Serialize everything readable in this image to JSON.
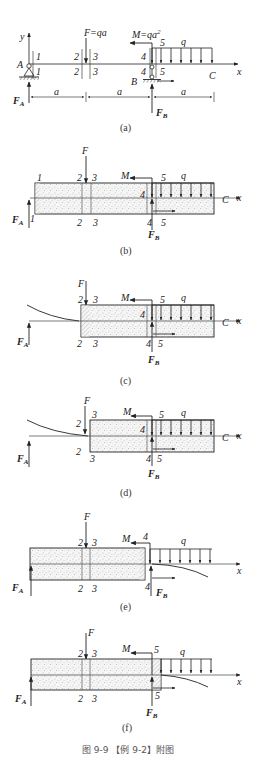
{
  "figure": {
    "caption": "图 9-9 【例 9-2】附图",
    "panels": [
      {
        "id": "a",
        "label": "(a)"
      },
      {
        "id": "b",
        "label": "(b)"
      },
      {
        "id": "c",
        "label": "(c)"
      },
      {
        "id": "d",
        "label": "(d)"
      },
      {
        "id": "e",
        "label": "(e)"
      },
      {
        "id": "f",
        "label": "(f)"
      }
    ]
  },
  "panel_a": {
    "axis_y": "y",
    "axis_x": "x",
    "point_A": "A",
    "point_B": "B",
    "point_C": "C",
    "force_F": "F=qa",
    "moment_M": "M=qa",
    "moment_exp": "2",
    "load_q": "q",
    "reaction_A": "F",
    "reaction_A_sub": "A",
    "reaction_B": "F",
    "reaction_B_sub": "B",
    "dim_1": "a",
    "dim_2": "a",
    "dim_3": "a",
    "sections": {
      "s1": "1",
      "s2": "2",
      "s3": "3",
      "s4": "4",
      "s5": "5"
    }
  },
  "labels": {
    "F": "F",
    "M": "M",
    "q": "q",
    "C": "C",
    "x": "x",
    "FA": "F",
    "FA_sub": "A",
    "FB": "F",
    "FB_sub": "B",
    "s1": "1",
    "s2": "2",
    "s3": "3",
    "s4": "4",
    "s5": "5"
  },
  "colors": {
    "line": "#222222",
    "stipple": "#9a9a9a",
    "box_fill": "#f4f4f4"
  }
}
